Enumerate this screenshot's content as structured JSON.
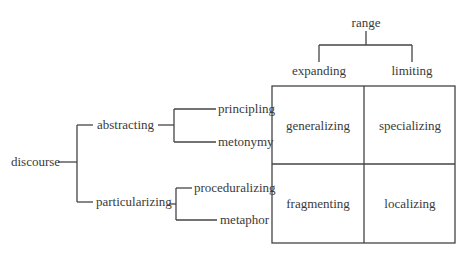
{
  "diagram": {
    "type": "tree-with-matrix",
    "left_tree": {
      "root": "discourse",
      "branches": [
        {
          "label": "abstracting",
          "children": [
            "principling",
            "metonymy"
          ]
        },
        {
          "label": "particularizing",
          "children": [
            "proceduralizing",
            "metaphor"
          ]
        }
      ]
    },
    "top_tree": {
      "root": "range",
      "children": [
        "expanding",
        "limiting"
      ]
    },
    "matrix": {
      "columns": [
        "expanding",
        "limiting"
      ],
      "rows": [
        "abstracting",
        "particularizing"
      ],
      "cells": [
        [
          "generalizing",
          "specializing"
        ],
        [
          "fragmenting",
          "localizing"
        ]
      ]
    },
    "colors": {
      "line": "#444444",
      "text": "#3a3a3a",
      "background": "#ffffff"
    }
  }
}
